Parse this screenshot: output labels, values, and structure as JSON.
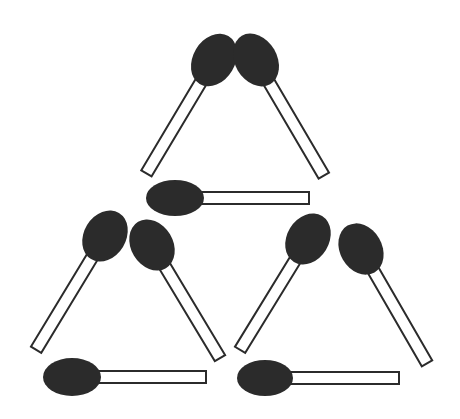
{
  "puzzle": {
    "title": "Matchstick puzzle: three triangles",
    "colors": {
      "head": "#2b2b2b",
      "stick_fill": "#ffffff",
      "stick_outline": "#2b2b2b",
      "background": "#ffffff"
    },
    "match_count": 9,
    "triangles": [
      {
        "name": "top",
        "matches": [
          1,
          2,
          3
        ]
      },
      {
        "name": "bottom-left",
        "matches": [
          4,
          5,
          6
        ]
      },
      {
        "name": "bottom-right",
        "matches": [
          7,
          8,
          9
        ]
      }
    ],
    "matches": [
      {
        "id": 1,
        "cx": 214,
        "cy": 60,
        "angle": 120.8,
        "length": 132,
        "rx": 28,
        "ry": 21
      },
      {
        "id": 2,
        "cx": 256,
        "cy": 60,
        "angle": 59.6,
        "length": 134,
        "rx": 28,
        "ry": 21
      },
      {
        "id": 3,
        "cx": 175,
        "cy": 198,
        "angle": 0,
        "length": 134,
        "rx": 29,
        "ry": 18
      },
      {
        "id": 4,
        "cx": 105,
        "cy": 236,
        "angle": 121.2,
        "length": 133,
        "rx": 27,
        "ry": 21
      },
      {
        "id": 5,
        "cx": 152,
        "cy": 245,
        "angle": 59,
        "length": 132,
        "rx": 27,
        "ry": 21
      },
      {
        "id": 6,
        "cx": 72,
        "cy": 377,
        "angle": 0,
        "length": 134,
        "rx": 29,
        "ry": 19
      },
      {
        "id": 7,
        "cx": 308,
        "cy": 239,
        "angle": 121.5,
        "length": 130,
        "rx": 27,
        "ry": 21
      },
      {
        "id": 8,
        "cx": 361,
        "cy": 249,
        "angle": 60,
        "length": 132,
        "rx": 27,
        "ry": 21
      },
      {
        "id": 9,
        "cx": 265,
        "cy": 378,
        "angle": 0,
        "length": 134,
        "rx": 28,
        "ry": 18
      }
    ]
  }
}
